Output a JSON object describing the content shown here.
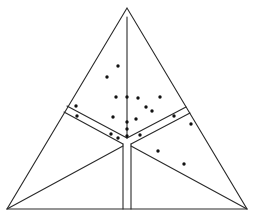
{
  "diagram": {
    "type": "ternary-plot",
    "background": "#ffffff",
    "line_color": "#2a2a2a",
    "dot_color": "#111111",
    "dot_radius": 1.7,
    "triangle": {
      "apex": [
        127,
        8
      ],
      "bottom_left": [
        7,
        209
      ],
      "bottom_right": [
        247,
        209
      ]
    },
    "lines": [
      {
        "name": "center-vertical-line",
        "from": [
          127,
          17
        ],
        "to": [
          127,
          138
        ]
      },
      {
        "name": "left-band-upper-line",
        "from": [
          67,
          106
        ],
        "to": [
          127,
          138
        ]
      },
      {
        "name": "left-band-lower-line",
        "from": [
          64,
          112
        ],
        "to": [
          123,
          144
        ]
      },
      {
        "name": "right-band-upper-line",
        "from": [
          127,
          138
        ],
        "to": [
          186,
          107
        ]
      },
      {
        "name": "right-band-lower-line",
        "from": [
          131,
          144
        ],
        "to": [
          190,
          113
        ]
      },
      {
        "name": "bottom-channel-left-line",
        "from": [
          123,
          144
        ],
        "to": [
          123,
          209
        ]
      },
      {
        "name": "bottom-channel-right-line",
        "from": [
          131,
          144
        ],
        "to": [
          131,
          209
        ]
      },
      {
        "name": "left-diagonal-line",
        "from": [
          7,
          209
        ],
        "to": [
          123,
          146
        ]
      },
      {
        "name": "right-diagonal-line",
        "from": [
          131,
          146
        ],
        "to": [
          247,
          209
        ]
      }
    ],
    "points": [
      [
        118,
        66
      ],
      [
        107,
        77
      ],
      [
        116,
        97
      ],
      [
        127,
        97
      ],
      [
        138,
        98
      ],
      [
        160,
        97
      ],
      [
        146,
        107
      ],
      [
        152,
        111
      ],
      [
        76,
        106
      ],
      [
        77,
        116
      ],
      [
        113,
        117
      ],
      [
        136,
        119
      ],
      [
        127,
        122
      ],
      [
        127,
        129
      ],
      [
        127,
        136
      ],
      [
        111,
        134
      ],
      [
        118,
        138
      ],
      [
        140,
        135
      ],
      [
        174,
        116
      ],
      [
        191,
        124
      ],
      [
        158,
        151
      ],
      [
        184,
        164
      ]
    ]
  }
}
